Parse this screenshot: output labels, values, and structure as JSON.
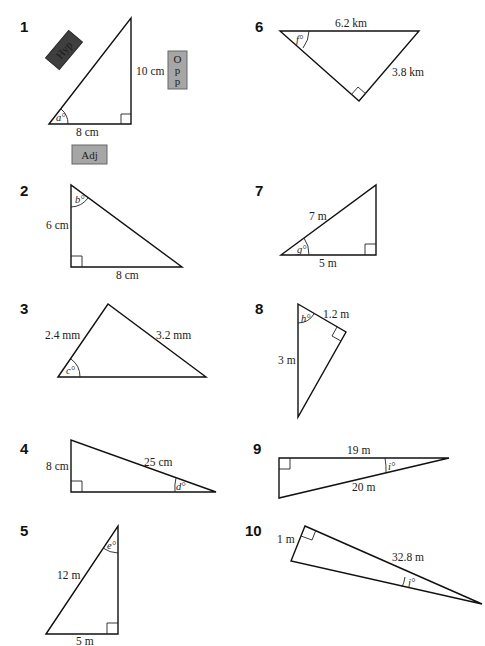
{
  "worksheet": {
    "problems": [
      {
        "number": "1",
        "sides": [
          "10 cm",
          "8 cm"
        ],
        "angle": "a°",
        "tags": {
          "hyp": "Hyp",
          "opp_letters": [
            "O",
            "p",
            "p"
          ],
          "adj": "Adj"
        }
      },
      {
        "number": "2",
        "sides": [
          "6 cm",
          "8 cm"
        ],
        "angle": "b°"
      },
      {
        "number": "3",
        "sides": [
          "2.4 mm",
          "3.2 mm"
        ],
        "angle": "c°"
      },
      {
        "number": "4",
        "sides": [
          "8 cm",
          "25 cm"
        ],
        "angle": "d°"
      },
      {
        "number": "5",
        "sides": [
          "12 m",
          "5 m"
        ],
        "angle": "e°"
      },
      {
        "number": "6",
        "sides": [
          "6.2 km",
          "3.8 km"
        ],
        "angle": "f°"
      },
      {
        "number": "7",
        "sides": [
          "7 m",
          "5 m"
        ],
        "angle": "g°"
      },
      {
        "number": "8",
        "sides": [
          "1.2 m",
          "3 m"
        ],
        "angle": "h°"
      },
      {
        "number": "9",
        "sides": [
          "19 m",
          "20 m"
        ],
        "angle": "i°"
      },
      {
        "number": "10",
        "sides": [
          "1 m",
          "32.8 m"
        ],
        "angle": "j°"
      }
    ]
  },
  "colors": {
    "hyp_tag": "#3f3f3f",
    "opp_tag": "#a6a6a6",
    "adj_tag": "#a6a6a6",
    "line": "#111111"
  }
}
